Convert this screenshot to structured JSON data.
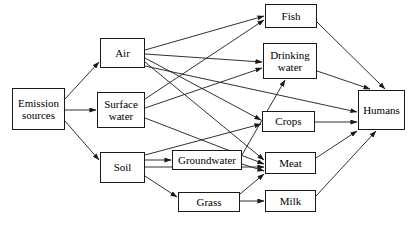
{
  "diagram": {
    "type": "flow-diagram",
    "width": 412,
    "height": 226,
    "background_color": "#ffffff",
    "line_color": "#1a1a1a",
    "text_color": "#000000",
    "nodes": [
      {
        "id": "emission_sources",
        "label": "Emission\nsources",
        "x": 12,
        "y": 88,
        "w": 53,
        "h": 42
      },
      {
        "id": "air",
        "label": "Air",
        "x": 100,
        "y": 38,
        "w": 45,
        "h": 30
      },
      {
        "id": "surface_water",
        "label": "Surface\nwater",
        "x": 97,
        "y": 92,
        "w": 48,
        "h": 36
      },
      {
        "id": "soil",
        "label": "Soil",
        "x": 100,
        "y": 152,
        "w": 45,
        "h": 31
      },
      {
        "id": "groundwater",
        "label": "Groundwater",
        "x": 172,
        "y": 150,
        "w": 70,
        "h": 20
      },
      {
        "id": "grass",
        "label": "Grass",
        "x": 178,
        "y": 192,
        "w": 62,
        "h": 20
      },
      {
        "id": "fish",
        "label": "Fish",
        "x": 265,
        "y": 4,
        "w": 52,
        "h": 24
      },
      {
        "id": "drinking_water",
        "label": "Drinking\nwater",
        "x": 263,
        "y": 43,
        "w": 54,
        "h": 36
      },
      {
        "id": "crops",
        "label": "Crops",
        "x": 262,
        "y": 111,
        "w": 53,
        "h": 21
      },
      {
        "id": "meat",
        "label": "Meat",
        "x": 265,
        "y": 152,
        "w": 51,
        "h": 22
      },
      {
        "id": "milk",
        "label": "Milk",
        "x": 265,
        "y": 190,
        "w": 51,
        "h": 22
      },
      {
        "id": "humans",
        "label": "Humans",
        "x": 358,
        "y": 90,
        "w": 47,
        "h": 40
      }
    ],
    "edges": [
      {
        "from": "emission_sources",
        "to": "air",
        "x1": 65,
        "y1": 99,
        "x2": 99,
        "y2": 62
      },
      {
        "from": "emission_sources",
        "to": "surface_water",
        "x1": 65,
        "y1": 110,
        "x2": 96,
        "y2": 110
      },
      {
        "from": "emission_sources",
        "to": "soil",
        "x1": 65,
        "y1": 121,
        "x2": 99,
        "y2": 160
      },
      {
        "from": "air",
        "to": "fish",
        "x1": 145,
        "y1": 50,
        "x2": 264,
        "y2": 16
      },
      {
        "from": "air",
        "to": "drinking_water",
        "x1": 145,
        "y1": 54,
        "x2": 262,
        "y2": 62
      },
      {
        "from": "air",
        "to": "crops",
        "x1": 145,
        "y1": 58,
        "x2": 261,
        "y2": 120
      },
      {
        "from": "air",
        "to": "meat",
        "x1": 145,
        "y1": 62,
        "x2": 264,
        "y2": 160
      },
      {
        "from": "surface_water",
        "to": "fish",
        "x1": 145,
        "y1": 99,
        "x2": 264,
        "y2": 20
      },
      {
        "from": "surface_water",
        "to": "drinking_water",
        "x1": 145,
        "y1": 108,
        "x2": 262,
        "y2": 68
      },
      {
        "from": "surface_water",
        "to": "meat",
        "x1": 145,
        "y1": 118,
        "x2": 264,
        "y2": 164
      },
      {
        "from": "soil",
        "to": "groundwater",
        "x1": 145,
        "y1": 160,
        "x2": 171,
        "y2": 160
      },
      {
        "from": "soil",
        "to": "crops",
        "x1": 145,
        "y1": 155,
        "x2": 261,
        "y2": 124
      },
      {
        "from": "soil",
        "to": "meat",
        "x1": 145,
        "y1": 167,
        "x2": 264,
        "y2": 167
      },
      {
        "from": "soil",
        "to": "grass",
        "x1": 145,
        "y1": 176,
        "x2": 177,
        "y2": 197
      },
      {
        "from": "groundwater",
        "to": "drinking_water",
        "x1": 242,
        "y1": 155,
        "x2": 285,
        "y2": 80
      },
      {
        "from": "groundwater",
        "to": "meat",
        "x1": 242,
        "y1": 164,
        "x2": 264,
        "y2": 171
      },
      {
        "from": "grass",
        "to": "milk",
        "x1": 240,
        "y1": 201,
        "x2": 264,
        "y2": 201
      },
      {
        "from": "grass",
        "to": "meat",
        "x1": 240,
        "y1": 194,
        "x2": 264,
        "y2": 174
      },
      {
        "from": "fish",
        "to": "humans",
        "x1": 317,
        "y1": 22,
        "x2": 385,
        "y2": 89
      },
      {
        "from": "drinking_water",
        "to": "humans",
        "x1": 317,
        "y1": 71,
        "x2": 370,
        "y2": 89
      },
      {
        "from": "crops",
        "to": "humans",
        "x1": 315,
        "y1": 122,
        "x2": 357,
        "y2": 122
      },
      {
        "from": "meat",
        "to": "humans",
        "x1": 316,
        "y1": 158,
        "x2": 357,
        "y2": 131
      },
      {
        "from": "milk",
        "to": "humans",
        "x1": 316,
        "y1": 196,
        "x2": 376,
        "y2": 131
      },
      {
        "from": "air_cross",
        "to": "humans",
        "x1": 145,
        "y1": 66,
        "x2": 357,
        "y2": 112
      }
    ]
  }
}
